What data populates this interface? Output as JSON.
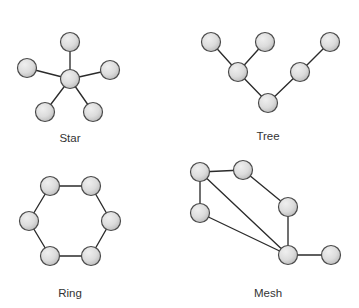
{
  "figure": {
    "background_color": "#ffffff",
    "node_fill_light": "#e8e8e8",
    "node_fill_dark": "#b9b9b9",
    "node_stroke_color": "#4a4a4a",
    "edge_color": "#2b2b2b",
    "label_color": "#333333",
    "node_radius": 9.5
  },
  "chart_data": {
    "type": "diagram",
    "diagram_kind": "node-link-graphs",
    "panel_count": 4,
    "panels": [
      {
        "id": "star",
        "label": "Star",
        "label_x": 70,
        "label_y": 139,
        "node_count": 6,
        "edge_count": 5,
        "nodes": [
          {
            "id": "s-center",
            "x": 70,
            "y": 79
          },
          {
            "id": "s-top",
            "x": 70,
            "y": 42
          },
          {
            "id": "s-left",
            "x": 27,
            "y": 68
          },
          {
            "id": "s-right",
            "x": 110,
            "y": 70
          },
          {
            "id": "s-bottom-left",
            "x": 45,
            "y": 112
          },
          {
            "id": "s-bottom-right",
            "x": 93,
            "y": 112
          }
        ],
        "edges": [
          [
            "s-center",
            "s-top"
          ],
          [
            "s-center",
            "s-left"
          ],
          [
            "s-center",
            "s-right"
          ],
          [
            "s-center",
            "s-bottom-left"
          ],
          [
            "s-center",
            "s-bottom-right"
          ]
        ]
      },
      {
        "id": "tree",
        "label": "Tree",
        "label_x": 268,
        "label_y": 137,
        "node_count": 6,
        "edge_count": 5,
        "nodes": [
          {
            "id": "t-root",
            "x": 268,
            "y": 103
          },
          {
            "id": "t-branch-left",
            "x": 238,
            "y": 72
          },
          {
            "id": "t-branch-right",
            "x": 300,
            "y": 72
          },
          {
            "id": "t-leaf-a",
            "x": 211,
            "y": 42
          },
          {
            "id": "t-leaf-b",
            "x": 265,
            "y": 42
          },
          {
            "id": "t-leaf-c",
            "x": 330,
            "y": 42
          }
        ],
        "edges": [
          [
            "t-root",
            "t-branch-left"
          ],
          [
            "t-root",
            "t-branch-right"
          ],
          [
            "t-branch-left",
            "t-leaf-a"
          ],
          [
            "t-branch-left",
            "t-leaf-b"
          ],
          [
            "t-branch-right",
            "t-leaf-c"
          ]
        ]
      },
      {
        "id": "ring",
        "label": "Ring",
        "label_x": 70,
        "label_y": 294,
        "node_count": 6,
        "edge_count": 6,
        "nodes": [
          {
            "id": "r-top-left",
            "x": 50,
            "y": 186
          },
          {
            "id": "r-top-right",
            "x": 91,
            "y": 186
          },
          {
            "id": "r-right",
            "x": 111,
            "y": 221
          },
          {
            "id": "r-bottom-right",
            "x": 91,
            "y": 256
          },
          {
            "id": "r-bottom-left",
            "x": 50,
            "y": 256
          },
          {
            "id": "r-left",
            "x": 29,
            "y": 221
          }
        ],
        "edges": [
          [
            "r-top-left",
            "r-top-right"
          ],
          [
            "r-top-right",
            "r-right"
          ],
          [
            "r-right",
            "r-bottom-right"
          ],
          [
            "r-bottom-right",
            "r-bottom-left"
          ],
          [
            "r-bottom-left",
            "r-left"
          ],
          [
            "r-left",
            "r-top-left"
          ]
        ]
      },
      {
        "id": "mesh",
        "label": "Mesh",
        "label_x": 268,
        "label_y": 294,
        "node_count": 6,
        "edge_count": 7,
        "nodes": [
          {
            "id": "m-top-left",
            "x": 200,
            "y": 172
          },
          {
            "id": "m-top-right",
            "x": 243,
            "y": 170
          },
          {
            "id": "m-left",
            "x": 200,
            "y": 213
          },
          {
            "id": "m-mid-right",
            "x": 288,
            "y": 207
          },
          {
            "id": "m-hub",
            "x": 288,
            "y": 255
          },
          {
            "id": "m-far-right",
            "x": 331,
            "y": 255
          }
        ],
        "edges": [
          [
            "m-top-left",
            "m-top-right"
          ],
          [
            "m-top-left",
            "m-left"
          ],
          [
            "m-top-left",
            "m-hub"
          ],
          [
            "m-top-right",
            "m-mid-right"
          ],
          [
            "m-left",
            "m-hub"
          ],
          [
            "m-mid-right",
            "m-hub"
          ],
          [
            "m-hub",
            "m-far-right"
          ]
        ]
      }
    ]
  }
}
